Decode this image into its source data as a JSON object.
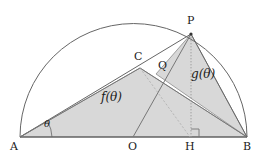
{
  "figure": {
    "colors": {
      "stroke": "#555555",
      "baseline": "#444444",
      "fill": "#d8d8d8",
      "fill_stroke": "#8c8c8c",
      "dotted": "#9a9a9a",
      "text": "#1a1a1a",
      "background": "#ffffff"
    },
    "points": [
      {
        "id": "A",
        "label": "A",
        "x": 20,
        "y": 137,
        "label_x": 10,
        "label_y": 141
      },
      {
        "id": "O",
        "label": "O",
        "x": 133,
        "y": 137,
        "label_x": 128,
        "label_y": 141
      },
      {
        "id": "H",
        "label": "H",
        "x": 190,
        "y": 137,
        "label_x": 185,
        "label_y": 141
      },
      {
        "id": "B",
        "label": "B",
        "x": 247,
        "y": 137,
        "label_x": 243,
        "label_y": 141
      },
      {
        "id": "P",
        "label": "P",
        "x": 191,
        "y": 34,
        "label_x": 187,
        "label_y": 16
      },
      {
        "id": "C",
        "label": "C",
        "x": 140,
        "y": 68,
        "label_x": 135,
        "label_y": 52
      },
      {
        "id": "Q",
        "label": "Q",
        "x": 156,
        "y": 74,
        "label_x": 158,
        "label_y": 61
      }
    ],
    "regions": [
      {
        "id": "f",
        "label": "f(θ)",
        "label_x": 101,
        "label_y": 97
      },
      {
        "id": "g",
        "label": "g(θ)",
        "label_x": 192,
        "label_y": 74
      }
    ],
    "angles": [
      {
        "id": "theta",
        "label": "θ",
        "label_x": 44,
        "label_y": 122
      }
    ],
    "markers": {
      "right_angle_at": "H",
      "right_angle_label": "right-angle-marker"
    },
    "semicircle": {
      "center_x": 133.5,
      "center_y": 137,
      "radius": 113.5
    }
  }
}
